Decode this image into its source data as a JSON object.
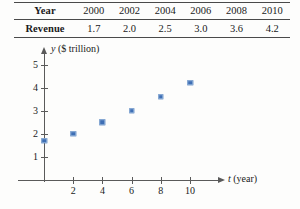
{
  "table": {
    "row_labels": [
      "Year",
      "Revenue"
    ],
    "years": [
      "2000",
      "2002",
      "2004",
      "2006",
      "2008",
      "2010"
    ],
    "revenues": [
      "1.7",
      "2.0",
      "2.5",
      "3.0",
      "3.6",
      "4.2"
    ]
  },
  "chart_data": {
    "type": "scatter",
    "title": "",
    "xlabel": "t (year)",
    "ylabel": "y ($ trillion)",
    "xlabel_var": "t",
    "xlabel_unit": "(year)",
    "ylabel_var": "y",
    "ylabel_unit": "($ trillion)",
    "x": [
      0,
      2,
      4,
      6,
      8,
      10
    ],
    "y": [
      1.7,
      2.0,
      2.5,
      3.0,
      3.6,
      4.2
    ],
    "xticks": [
      "2",
      "4",
      "6",
      "8",
      "10"
    ],
    "xtick_values": [
      2,
      4,
      6,
      8,
      10
    ],
    "yticks": [
      "1",
      "2",
      "3",
      "4",
      "5"
    ],
    "ytick_values": [
      1,
      2,
      3,
      4,
      5
    ],
    "xlim": [
      0,
      11
    ],
    "ylim": [
      0,
      5.6
    ],
    "grid": false,
    "legend": "none",
    "point_color": "#3f6fb5"
  }
}
